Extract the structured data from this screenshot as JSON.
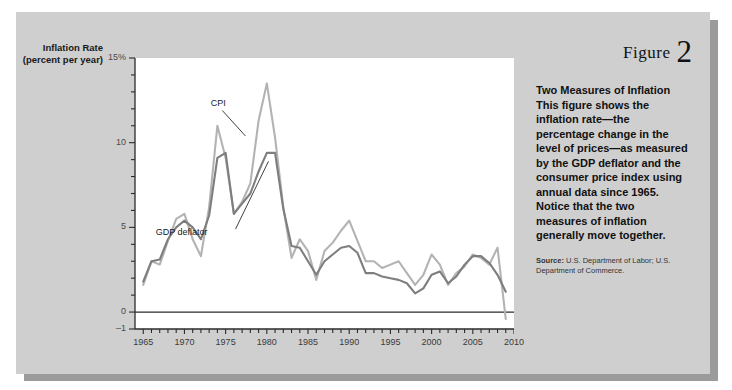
{
  "figure": {
    "number_word": "Figure",
    "number": "2",
    "title": "Two Measures of Inflation",
    "body": "This figure shows the inflation rate—the percentage change in the level of prices—as measured by the GDP deflator and the consumer price index using annual data since 1965. Notice that the two measures of inflation generally move together.",
    "source_label": "Source:",
    "source_text": "U.S. Department of Labor; U.S. Department of Commerce."
  },
  "colors": {
    "card_background": "#cfcfcf",
    "card_shadow": "#9b9b9b",
    "plot_background": "#ffffff",
    "axis": "#2b2b2b",
    "cpi_line": "#b3b3b3",
    "gdp_deflator_line": "#7e7e7e",
    "tick_text": "#3a3a3a"
  },
  "chart_data": {
    "type": "line",
    "title": "",
    "xlabel": "",
    "ylabel": "Inflation Rate",
    "ylabel_units": "(percent per year)",
    "ylim": [
      -1,
      15
    ],
    "xlim": [
      1964,
      2010
    ],
    "grid": false,
    "legend": "annotations on plot",
    "y_ticks": [
      -1,
      0,
      5,
      10,
      15
    ],
    "y_tick_labels": [
      "–1",
      "0",
      "5",
      "10",
      "15%"
    ],
    "y_minor_tick_step": 1,
    "x_ticks": [
      1965,
      1970,
      1975,
      1980,
      1985,
      1990,
      1995,
      2000,
      2005,
      2010
    ],
    "x_tick_labels": [
      "1965",
      "1970",
      "1975",
      "1980",
      "1985",
      "1990",
      "1995",
      "2000",
      "2005",
      "2010"
    ],
    "x_minor_tick_step": 1,
    "x": [
      1965,
      1966,
      1967,
      1968,
      1969,
      1970,
      1971,
      1972,
      1973,
      1974,
      1975,
      1976,
      1977,
      1978,
      1979,
      1980,
      1981,
      1982,
      1983,
      1984,
      1985,
      1986,
      1987,
      1988,
      1989,
      1990,
      1991,
      1992,
      1993,
      1994,
      1995,
      1996,
      1997,
      1998,
      1999,
      2000,
      2001,
      2002,
      2003,
      2004,
      2005,
      2006,
      2007,
      2008,
      2009
    ],
    "series": [
      {
        "name": "CPI",
        "color": "#b3b3b3",
        "annotation_label": "CPI",
        "values": [
          1.6,
          3.0,
          2.8,
          4.2,
          5.5,
          5.8,
          4.3,
          3.3,
          6.2,
          11.0,
          9.1,
          5.8,
          6.5,
          7.6,
          11.3,
          13.5,
          10.3,
          6.2,
          3.2,
          4.3,
          3.6,
          1.9,
          3.6,
          4.1,
          4.8,
          5.4,
          4.2,
          3.0,
          3.0,
          2.6,
          2.8,
          3.0,
          2.3,
          1.6,
          2.2,
          3.4,
          2.8,
          1.6,
          2.3,
          2.7,
          3.4,
          3.2,
          2.8,
          3.8,
          -0.4
        ]
      },
      {
        "name": "GDP deflator",
        "color": "#7e7e7e",
        "annotation_label": "GDP deflator",
        "values": [
          1.8,
          3.0,
          3.1,
          4.3,
          5.0,
          5.4,
          5.0,
          4.3,
          5.7,
          9.1,
          9.4,
          5.8,
          6.4,
          7.0,
          8.3,
          9.4,
          9.4,
          6.1,
          3.9,
          3.8,
          3.0,
          2.2,
          3.0,
          3.4,
          3.8,
          3.9,
          3.5,
          2.3,
          2.3,
          2.1,
          2.0,
          1.9,
          1.7,
          1.1,
          1.4,
          2.2,
          2.4,
          1.7,
          2.1,
          2.8,
          3.3,
          3.3,
          2.9,
          2.2,
          1.2
        ]
      }
    ],
    "annotations": [
      {
        "text": "CPI",
        "x": 1973.2,
        "y": 12.2
      },
      {
        "text": "GDP deflator",
        "x": 1972.8,
        "y": 4.6
      }
    ]
  }
}
